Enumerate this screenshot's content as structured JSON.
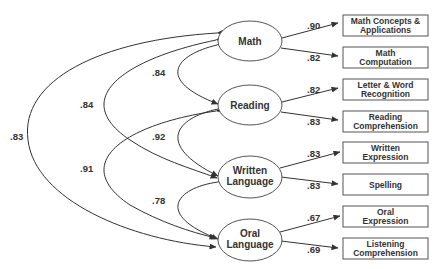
{
  "diagram": {
    "type": "structural-equation-model",
    "factors": [
      {
        "id": "math",
        "label_lines": [
          "Math"
        ]
      },
      {
        "id": "reading",
        "label_lines": [
          "Reading"
        ]
      },
      {
        "id": "written",
        "label_lines": [
          "Written",
          "Language"
        ]
      },
      {
        "id": "oral",
        "label_lines": [
          "Oral",
          "Language"
        ]
      }
    ],
    "indicators": [
      {
        "factor": "math",
        "label_lines": [
          "Math Concepts &",
          "Applications"
        ],
        "loading": ".90"
      },
      {
        "factor": "math",
        "label_lines": [
          "Math",
          "Computation"
        ],
        "loading": ".82"
      },
      {
        "factor": "reading",
        "label_lines": [
          "Letter & Word",
          "Recognition"
        ],
        "loading": ".82"
      },
      {
        "factor": "reading",
        "label_lines": [
          "Reading",
          "Comprehension"
        ],
        "loading": ".83"
      },
      {
        "factor": "written",
        "label_lines": [
          "Written",
          "Expression"
        ],
        "loading": ".83"
      },
      {
        "factor": "written",
        "label_lines": [
          "Spelling"
        ],
        "loading": ".83"
      },
      {
        "factor": "oral",
        "label_lines": [
          "Oral",
          "Expression"
        ],
        "loading": ".67"
      },
      {
        "factor": "oral",
        "label_lines": [
          "Listening",
          "Comprehension"
        ],
        "loading": ".69"
      }
    ],
    "correlations": [
      {
        "from": "math",
        "to": "reading",
        "value": ".84"
      },
      {
        "from": "reading",
        "to": "written",
        "value": ".92"
      },
      {
        "from": "written",
        "to": "oral",
        "value": ".78"
      },
      {
        "from": "math",
        "to": "written",
        "value": ".84"
      },
      {
        "from": "reading",
        "to": "oral",
        "value": ".91"
      },
      {
        "from": "math",
        "to": "oral",
        "value": ".83"
      }
    ]
  }
}
